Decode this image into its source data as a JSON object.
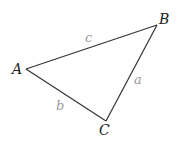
{
  "diagram": {
    "type": "triangle",
    "stroke_color": "#333333",
    "vertex_label_color": "#222222",
    "side_label_color": "#9a9a9a",
    "vertices": [
      {
        "id": "A",
        "label": "A",
        "x": 26,
        "y": 69,
        "label_x": 12,
        "label_y": 74
      },
      {
        "id": "B",
        "label": "B",
        "x": 157,
        "y": 25,
        "label_x": 159,
        "label_y": 24
      },
      {
        "id": "C",
        "label": "C",
        "x": 106,
        "y": 121,
        "label_x": 99,
        "label_y": 135
      }
    ],
    "sides": [
      {
        "id": "a",
        "label": "a",
        "from": "B",
        "to": "C",
        "label_x": 134,
        "label_y": 84
      },
      {
        "id": "b",
        "label": "b",
        "from": "A",
        "to": "C",
        "label_x": 56,
        "label_y": 110
      },
      {
        "id": "c",
        "label": "c",
        "from": "A",
        "to": "B",
        "label_x": 85,
        "label_y": 42
      }
    ]
  }
}
